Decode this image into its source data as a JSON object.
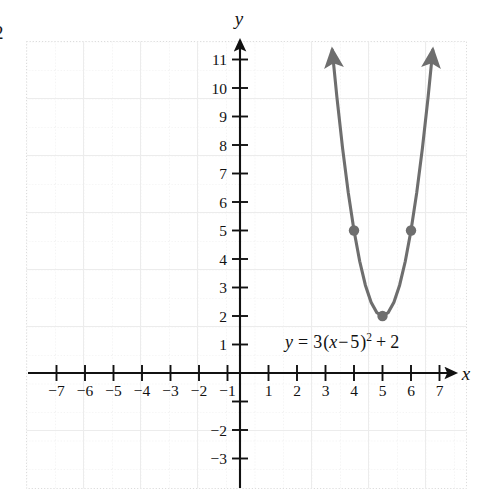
{
  "page_number": "2",
  "chart_data": {
    "type": "line",
    "title": "",
    "subtitle": "",
    "xlabel": "x",
    "ylabel": "y",
    "equation": "y = 3(x − 5)² + 2",
    "equation_parts": {
      "lhs": "y",
      "equals": "=",
      "coefficient": "3",
      "open_paren": "(",
      "variable": "x",
      "minus": "−",
      "shift": "5",
      "close_paren": ")",
      "exponent": "2",
      "plus": "+",
      "constant": "2"
    },
    "function": "y = 3(x - 5)^2 + 2",
    "vertex": [
      5,
      2
    ],
    "xlim": [
      -7.5,
      7.9
    ],
    "ylim": [
      -3.9,
      11.9
    ],
    "grid": true,
    "grid_style": "dotted",
    "grid_spacing": 1,
    "legend": "none",
    "x_ticks": [
      -7,
      -6,
      -5,
      -4,
      -3,
      -2,
      -1,
      1,
      2,
      3,
      4,
      5,
      6,
      7
    ],
    "x_tick_labels": [
      "−7",
      "−6",
      "−5",
      "−4",
      "−3",
      "−2",
      "−1",
      "1",
      "2",
      "3",
      "4",
      "5",
      "6",
      "7"
    ],
    "y_ticks": [
      11,
      10,
      9,
      8,
      7,
      6,
      5,
      4,
      3,
      2,
      1,
      -2,
      -3
    ],
    "y_tick_labels": [
      "11",
      "10",
      "9",
      "8",
      "7",
      "6",
      "5",
      "4",
      "3",
      "2",
      "1",
      "−2",
      "−3"
    ],
    "marked_points": [
      {
        "x": 4,
        "y": 5,
        "label": "(4, 5)"
      },
      {
        "x": 5,
        "y": 2,
        "label": "(5, 2)"
      },
      {
        "x": 6,
        "y": 5,
        "label": "(6, 5)"
      }
    ],
    "curve_points": [
      {
        "x": 3.2361,
        "y": 11.33
      },
      {
        "x": 3.4,
        "y": 9.68
      },
      {
        "x": 3.6,
        "y": 7.88
      },
      {
        "x": 3.8,
        "y": 6.32
      },
      {
        "x": 4.0,
        "y": 5.0
      },
      {
        "x": 4.2,
        "y": 3.92
      },
      {
        "x": 4.4,
        "y": 3.08
      },
      {
        "x": 4.6,
        "y": 2.48
      },
      {
        "x": 4.8,
        "y": 2.12
      },
      {
        "x": 5.0,
        "y": 2.0
      },
      {
        "x": 5.2,
        "y": 2.12
      },
      {
        "x": 5.4,
        "y": 2.48
      },
      {
        "x": 5.6,
        "y": 3.08
      },
      {
        "x": 5.8,
        "y": 3.92
      },
      {
        "x": 6.0,
        "y": 5.0
      },
      {
        "x": 6.2,
        "y": 6.32
      },
      {
        "x": 6.4,
        "y": 7.88
      },
      {
        "x": 6.6,
        "y": 9.68
      },
      {
        "x": 6.7639,
        "y": 11.33
      }
    ],
    "arrow_ends": [
      "left-branch-up",
      "right-branch-up"
    ],
    "colors": {
      "curve": "#6e6e6e",
      "point": "#6e6e6e",
      "axis": "#111111",
      "grid": "#dcdcdc",
      "grid_minor": "#e9e9e9",
      "text": "#111111",
      "background": "#ffffff"
    }
  }
}
